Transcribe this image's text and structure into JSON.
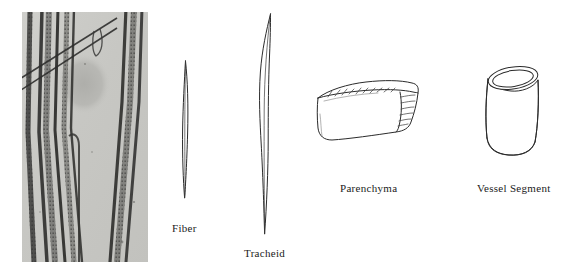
{
  "figure": {
    "background_color": "#ffffff",
    "ink_color": "#2b2b2b",
    "width": 568,
    "height": 268
  },
  "micrograph": {
    "name": "wood-fiber-photomicrograph",
    "description": "Photomicrograph of elongated wood fiber cells with pitted walls on a pale gray field",
    "background_color": "#c9c9c6",
    "fiber_color": "#3a3a38"
  },
  "specimens": [
    {
      "id": "fiber",
      "label": "Fiber",
      "shape": "spindle",
      "description": "Long slender cell tapered to sharp points at both ends"
    },
    {
      "id": "tracheid",
      "label": "Tracheid",
      "shape": "elongated-spindle",
      "description": "Very long slender cell, tapered ends, longer than a fiber"
    },
    {
      "id": "parenchyma",
      "label": "Parenchyma",
      "shape": "brick-block",
      "description": "Short boxy brick-shaped cell drawn in three-quarter view with hatched shading"
    },
    {
      "id": "vessel-segment",
      "label": "Vessel Segment",
      "shape": "open-cylinder",
      "description": "Short wide open-ended tube with an elliptical rim at the top"
    }
  ]
}
